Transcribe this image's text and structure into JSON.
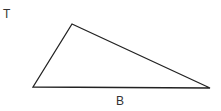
{
  "diagram": {
    "labels": {
      "top_left": "T",
      "bottom": "B"
    },
    "triangle": {
      "vertices": [
        [
          33,
          87
        ],
        [
          72,
          24
        ],
        [
          210,
          88
        ]
      ],
      "stroke": "#222222"
    }
  }
}
